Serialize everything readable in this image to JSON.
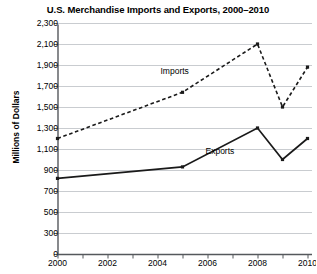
{
  "chart_data": {
    "type": "line",
    "title": "U.S. Merchandise Imports and Exports, 2000–2010",
    "xlabel": "",
    "ylabel": "Millions of Dollars",
    "x": [
      2000,
      2005,
      2008,
      2009,
      2010
    ],
    "xlim": [
      2000,
      2010
    ],
    "ylim": [
      0,
      2300
    ],
    "grid": true,
    "axis_break": true,
    "legend_position": "inline-annotation",
    "xticks": [
      2000,
      2001,
      2002,
      2003,
      2004,
      2005,
      2006,
      2007,
      2008,
      2009,
      2010
    ],
    "xticklabels": [
      "2000",
      "",
      "2002",
      "",
      "2004",
      "",
      "2006",
      "",
      "2008",
      "",
      "2010"
    ],
    "xticklabels_shown": [
      "2000",
      "2002",
      "2004",
      "2006",
      "2008",
      "2010"
    ],
    "yticks": [
      0,
      300,
      500,
      700,
      900,
      1100,
      1300,
      1500,
      1700,
      1900,
      2100,
      2300
    ],
    "yticklabels": [
      "0",
      "300",
      "500",
      "700",
      "900",
      "1,100",
      "1,300",
      "1,500",
      "1,700",
      "1,900",
      "2,100",
      "2,300"
    ],
    "series": [
      {
        "name": "Imports",
        "style": "dashed",
        "color": "#1a1a1a",
        "x": [
          2000,
          2005,
          2008,
          2009,
          2010
        ],
        "values": [
          1200,
          1640,
          2100,
          1500,
          1880
        ]
      },
      {
        "name": "Exports",
        "style": "solid",
        "color": "#1a1a1a",
        "x": [
          2000,
          2005,
          2008,
          2009,
          2010
        ],
        "values": [
          820,
          930,
          1300,
          1000,
          1200
        ]
      }
    ],
    "annotations": [
      {
        "text": "Imports",
        "x": 2005.0,
        "y": 1830
      },
      {
        "text": "Exports",
        "x": 2006.8,
        "y": 1070
      }
    ]
  },
  "colors": {
    "axis": "#55585c",
    "grid": "#c9ccd0",
    "ink": "#1a1a1a",
    "background": "#ffffff"
  }
}
